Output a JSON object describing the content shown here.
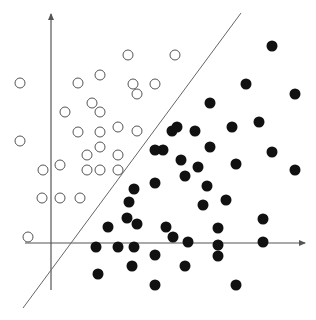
{
  "diagram": {
    "title": "",
    "colors": {
      "background": "#ffffff",
      "axis": "#555555",
      "separator": "#666666",
      "open_stroke": "#555555",
      "filled": "#111111"
    },
    "axes": {
      "y_axis": {
        "x": 51,
        "y_top": 14,
        "y_bottom": 290
      },
      "x_axis": {
        "y": 243,
        "x_left": 25,
        "x_right": 305
      }
    },
    "separator_line": {
      "x1": 241,
      "y1": 13,
      "x2": 23,
      "y2": 308
    },
    "marker_radius": 5,
    "class_open": [
      [
        20,
        83
      ],
      [
        20,
        141
      ],
      [
        43,
        170
      ],
      [
        42,
        198
      ],
      [
        60,
        198
      ],
      [
        60,
        165
      ],
      [
        28,
        237
      ],
      [
        65,
        112
      ],
      [
        78,
        132
      ],
      [
        78,
        83
      ],
      [
        87,
        170
      ],
      [
        87,
        155
      ],
      [
        92,
        103
      ],
      [
        100,
        75
      ],
      [
        100,
        112
      ],
      [
        100,
        132
      ],
      [
        100,
        147
      ],
      [
        100,
        170
      ],
      [
        80,
        198
      ],
      [
        118,
        127
      ],
      [
        118,
        155
      ],
      [
        118,
        170
      ],
      [
        128,
        55
      ],
      [
        133,
        84
      ],
      [
        137,
        94
      ],
      [
        155,
        84
      ],
      [
        137,
        131
      ],
      [
        175,
        55
      ]
    ],
    "class_filled": [
      [
        272,
        46
      ],
      [
        246,
        84
      ],
      [
        295,
        94
      ],
      [
        210,
        103
      ],
      [
        172,
        131
      ],
      [
        163,
        150
      ],
      [
        155,
        150
      ],
      [
        181,
        160
      ],
      [
        195,
        131
      ],
      [
        210,
        147
      ],
      [
        232,
        127
      ],
      [
        259,
        122
      ],
      [
        177,
        127
      ],
      [
        198,
        167
      ],
      [
        185,
        176
      ],
      [
        207,
        186
      ],
      [
        236,
        164
      ],
      [
        272,
        152
      ],
      [
        295,
        170
      ],
      [
        134,
        189
      ],
      [
        155,
        183
      ],
      [
        203,
        205
      ],
      [
        226,
        200
      ],
      [
        129,
        202
      ],
      [
        127,
        218
      ],
      [
        137,
        224
      ],
      [
        108,
        227
      ],
      [
        166,
        227
      ],
      [
        218,
        228
      ],
      [
        263,
        219
      ],
      [
        173,
        237
      ],
      [
        188,
        242
      ],
      [
        96,
        247
      ],
      [
        118,
        247
      ],
      [
        134,
        247
      ],
      [
        218,
        245
      ],
      [
        263,
        242
      ],
      [
        155,
        255
      ],
      [
        132,
        266
      ],
      [
        185,
        266
      ],
      [
        218,
        256
      ],
      [
        98,
        274
      ],
      [
        155,
        285
      ],
      [
        236,
        285
      ]
    ]
  }
}
